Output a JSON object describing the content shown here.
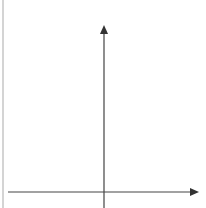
{
  "diagram": {
    "type": "coordinate-axes",
    "axes": {
      "x_axis": {
        "direction": "right",
        "arrowhead": true
      },
      "y_axis": {
        "direction": "up",
        "arrowhead": true
      }
    },
    "labels": [],
    "colors": {
      "background": "#ffffff",
      "axis": "#444444",
      "border": "#b8b8b8"
    }
  }
}
